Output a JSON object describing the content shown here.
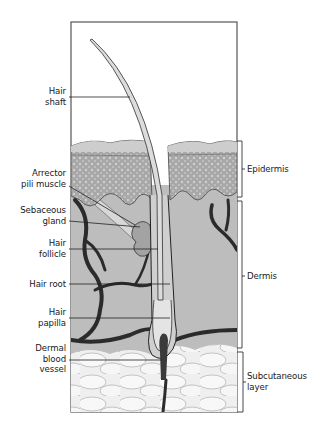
{
  "figure": {
    "colors": {
      "frame": "#555555",
      "epidermis": "#a9a9a9",
      "dermis": "#bdbdbd",
      "subcutaneous": "#eeeeee",
      "vessel": "#2b2b2b",
      "hair": "#dcdcdc",
      "leader_line": "#222222"
    }
  },
  "labels_left": [
    {
      "id": "hair-shaft",
      "lines": [
        "Hair",
        "shaft"
      ]
    },
    {
      "id": "arrector-pili-muscle",
      "lines": [
        "Arrector",
        "pili muscle"
      ]
    },
    {
      "id": "sebaceous-gland",
      "lines": [
        "Sebaceous",
        "gland"
      ]
    },
    {
      "id": "hair-follicle",
      "lines": [
        "Hair",
        "follicle"
      ]
    },
    {
      "id": "hair-root",
      "lines": [
        "Hair root"
      ]
    },
    {
      "id": "hair-papilla",
      "lines": [
        "Hair",
        "papilla"
      ]
    },
    {
      "id": "dermal-blood-vessel",
      "lines": [
        "Dermal",
        "blood",
        "vessel"
      ]
    }
  ],
  "labels_right": [
    {
      "id": "epidermis",
      "lines": [
        "Epidermis"
      ]
    },
    {
      "id": "dermis",
      "lines": [
        "Dermis"
      ]
    },
    {
      "id": "subcutaneous-layer",
      "lines": [
        "Subcutaneous",
        "layer"
      ]
    }
  ]
}
